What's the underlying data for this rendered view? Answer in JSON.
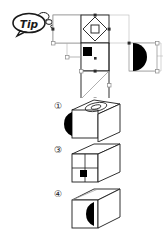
{
  "page": {
    "kind": "spatial-reasoning-worksheet",
    "background_color": "#ffffff",
    "ink_color": "#1a1a1a",
    "fill_color": "#000000",
    "handle_color": "#7a7a7a"
  },
  "tip_badge": {
    "label": "Tip",
    "shape": "speech-bubble",
    "outline_color": "#1a1a1a"
  },
  "net_diagram": {
    "title": "cube net with face patterns",
    "faces": [
      {
        "id": "face-top-left",
        "pattern": "blank",
        "label": ""
      },
      {
        "id": "face-diamond",
        "pattern": "diamond-with-square",
        "label": ""
      },
      {
        "id": "face-black-square",
        "pattern": "small-black-square",
        "label": ""
      },
      {
        "id": "face-semicircle",
        "pattern": "black-semicircle-right",
        "label": ""
      },
      {
        "id": "face-diagonal",
        "pattern": "diagonal-line",
        "label": ""
      }
    ],
    "handles_visible": true,
    "handle_count": 16
  },
  "options": [
    {
      "number": "①",
      "name": "option-1",
      "cube": {
        "front_face": "black-semicircle-left",
        "top_face": "oval-diamond-pattern",
        "right_face": "blank"
      }
    },
    {
      "number": "③",
      "name": "option-3",
      "cube": {
        "front_face": "cross-grid-with-small-black-square",
        "top_face": "blank",
        "right_face": "blank"
      }
    },
    {
      "number": "④",
      "name": "option-4",
      "cube": {
        "front_face": "black-semicircle-flat-right",
        "top_face": "blank",
        "right_face": "blank"
      }
    }
  ]
}
